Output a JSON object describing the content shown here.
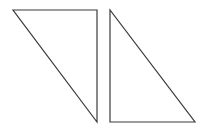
{
  "diagram": {
    "stroke_color": "#3a3a3a",
    "background_color": "#ffffff",
    "shapes": [
      {
        "id": "left-triangle",
        "type": "right-triangle",
        "right_angle_corner": "top-right",
        "label": ""
      },
      {
        "id": "right-triangle",
        "type": "right-triangle",
        "right_angle_corner": "bottom-left",
        "label": ""
      }
    ]
  }
}
